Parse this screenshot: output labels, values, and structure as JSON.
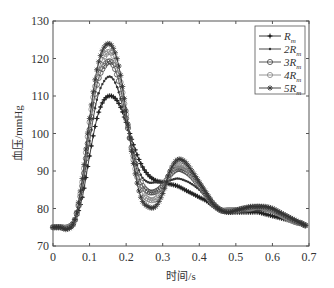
{
  "chart_data": {
    "type": "line",
    "title": "",
    "xlabel": "时间/s",
    "ylabel": "血压/mmHg",
    "xlim": [
      0,
      0.7
    ],
    "ylim": [
      70,
      130
    ],
    "xticks": [
      "0",
      "0.1",
      "0.2",
      "0.3",
      "0.4",
      "0.5",
      "0.6",
      "0.7"
    ],
    "yticks": [
      "70",
      "80",
      "90",
      "100",
      "110",
      "120",
      "130"
    ],
    "grid": false,
    "legend_position": "upper right",
    "x": [
      0,
      0.02,
      0.04,
      0.06,
      0.08,
      0.1,
      0.12,
      0.14,
      0.16,
      0.18,
      0.2,
      0.22,
      0.24,
      0.26,
      0.28,
      0.3,
      0.32,
      0.34,
      0.36,
      0.38,
      0.4,
      0.42,
      0.44,
      0.46,
      0.48,
      0.5,
      0.52,
      0.54,
      0.56,
      0.58,
      0.6,
      0.62,
      0.64,
      0.66,
      0.68,
      0.69
    ],
    "series": [
      {
        "name": "R_m",
        "legend_main": "R",
        "legend_sub": "m",
        "marker": "plus-dot",
        "color": "#222222",
        "values": [
          75,
          75,
          75,
          77,
          83,
          94,
          104,
          109,
          110,
          108,
          103,
          97,
          92,
          89,
          87.5,
          87,
          86.5,
          86,
          85,
          84,
          83,
          82,
          80.5,
          79.5,
          79,
          79,
          79,
          79,
          79,
          78.5,
          78,
          77.5,
          77,
          76.5,
          76,
          75.5
        ]
      },
      {
        "name": "2R_m",
        "legend_main": "2R",
        "legend_sub": "m",
        "marker": "dot",
        "color": "#333333",
        "values": [
          75,
          75,
          75,
          77,
          85,
          98,
          109,
          114,
          115,
          111,
          103,
          95,
          89,
          87,
          87,
          87,
          87.5,
          88,
          87.5,
          86.5,
          85,
          83,
          81,
          80,
          79.5,
          79.5,
          79.5,
          79.5,
          79.5,
          79.5,
          79,
          78,
          77,
          76.5,
          76,
          75.5
        ]
      },
      {
        "name": "3R_m",
        "legend_main": "3R",
        "legend_sub": "m",
        "marker": "circle",
        "color": "#444444",
        "values": [
          75,
          75,
          75,
          77,
          86,
          101,
          113,
          118,
          119,
          114,
          104,
          94,
          87,
          84.5,
          84.5,
          86,
          89,
          90.5,
          90,
          88.5,
          86,
          83.5,
          81,
          79.5,
          79.5,
          79.5,
          79.5,
          80,
          80,
          80,
          79.5,
          78.5,
          77.5,
          76.5,
          76,
          75.5
        ]
      },
      {
        "name": "4R_m",
        "legend_main": "4R",
        "legend_sub": "m",
        "marker": "circle-light",
        "color": "#888888",
        "values": [
          75,
          75,
          75,
          77,
          87,
          103,
          115,
          120.5,
          121.5,
          116,
          105,
          93,
          85,
          82.5,
          82.5,
          85,
          89.5,
          91.5,
          91,
          89,
          86.5,
          83.5,
          81,
          79.5,
          79.5,
          79.5,
          80,
          80,
          80.5,
          80,
          79.5,
          78.5,
          77.5,
          76.5,
          76,
          75.5
        ]
      },
      {
        "name": "5R_m",
        "legend_main": "5R",
        "legend_sub": "m",
        "marker": "star",
        "color": "#333333",
        "values": [
          75,
          75,
          74.5,
          77,
          88,
          104,
          117,
          123,
          123.5,
          118,
          106,
          92,
          83,
          80.5,
          80.5,
          84,
          90,
          93,
          92.5,
          90,
          87,
          84,
          81,
          79.5,
          79,
          79.5,
          80,
          80.5,
          80.5,
          80.5,
          80,
          79,
          78,
          77,
          76,
          75.5
        ]
      }
    ]
  }
}
